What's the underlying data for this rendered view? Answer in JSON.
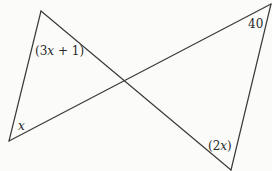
{
  "diagram": {
    "type": "two triangles formed by intersecting lines (bowtie)",
    "stroke_color": "#3a3a3a",
    "background": "#fbfbf9",
    "vertices": {
      "top_left": [
        41,
        11
      ],
      "bottom_left": [
        9,
        141
      ],
      "top_right": [
        271,
        4
      ],
      "bottom_right": [
        231,
        170
      ],
      "intersection": [
        124,
        82
      ]
    },
    "segments": [
      {
        "name": "left-side",
        "from": "top_left",
        "to": "bottom_left"
      },
      {
        "name": "diagonal-down",
        "from": "top_left",
        "to": "bottom_right"
      },
      {
        "name": "diagonal-up",
        "from": "bottom_left",
        "to": "top_right"
      },
      {
        "name": "right-side",
        "from": "top_right",
        "to": "bottom_right"
      }
    ],
    "labels": {
      "top_left_angle": "(3x + 1)",
      "bottom_left_angle": "x",
      "top_right_angle": "40",
      "bottom_right_angle": "(2x)"
    }
  }
}
